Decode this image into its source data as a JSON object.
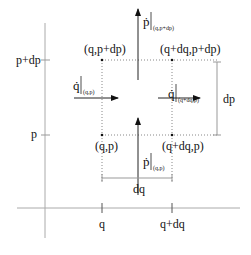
{
  "diagram": {
    "axes": {
      "vertical_ticks": [
        {
          "label": "p+dp",
          "y": 60
        },
        {
          "label": "p",
          "y": 135
        }
      ],
      "horizontal_ticks": [
        {
          "label": "q",
          "x": 102
        },
        {
          "label": "q+dq",
          "x": 172
        }
      ]
    },
    "corners": {
      "bottom_left": "(q,p)",
      "bottom_right": "(q+dq,p)",
      "top_left": "(q,p+dp)",
      "top_right": "(q+dq,p+dp)"
    },
    "flows": {
      "p_dot_top": {
        "symbol": "ṗ",
        "sub": "(q,p+dp)"
      },
      "p_dot_bottom": {
        "symbol": "ṗ",
        "sub": "(q,p)"
      },
      "q_dot_left": {
        "symbol": "q̇",
        "sub": "(q,p)"
      },
      "q_dot_right": {
        "symbol": "q̇",
        "sub": "(q+dq,p)"
      }
    },
    "dimensions": {
      "dp": "dp",
      "dq": "dq"
    },
    "colors": {
      "axis": "#999999",
      "line": "#222222",
      "dotted": "#888888"
    }
  }
}
